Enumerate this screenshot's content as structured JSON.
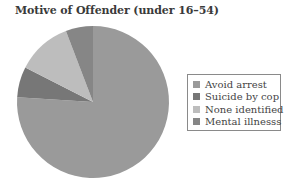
{
  "chart_data": {
    "type": "pie",
    "title": "Motive of Offender (under 16–54)",
    "categories": [
      "Avoid arrest",
      "Suicide by cop",
      "None identified",
      "Mental illnesss"
    ],
    "values": [
      76,
      6.5,
      11.7,
      5.8
    ],
    "unit": "%",
    "colors": [
      "#9a9a9a",
      "#777777",
      "#bdbdbd",
      "#868686"
    ],
    "start_angle_deg": 0,
    "direction": "clockwise",
    "legend_position": "right"
  },
  "title": "Motive of Offender (under 16–54)",
  "legend": [
    {
      "label": "Avoid arrest",
      "color": "#9a9a9a"
    },
    {
      "label": "Suicide by cop",
      "color": "#777777"
    },
    {
      "label": "None identified",
      "color": "#bdbdbd"
    },
    {
      "label": "Mental illnesss",
      "color": "#868686"
    }
  ]
}
